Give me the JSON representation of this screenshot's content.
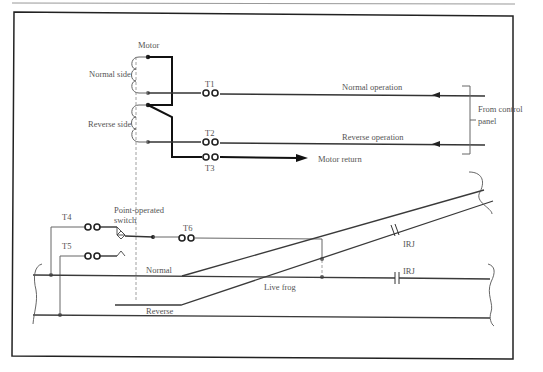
{
  "diagram": {
    "labels": {
      "motor": "Motor",
      "normal_side": "Normal side",
      "reverse_side": "Reverse side",
      "t1": "T1",
      "t2": "T2",
      "t3": "T3",
      "t4": "T4",
      "t5": "T5",
      "t6": "T6",
      "normal_operation": "Normal operation",
      "reverse_operation": "Reverse operation",
      "from_control_panel_1": "From control",
      "from_control_panel_2": "panel",
      "motor_return": "Motor return",
      "point_operated_1": "Point-operated",
      "point_operated_2": "switch",
      "irj_upper": "IRJ",
      "irj_lower": "IRJ",
      "normal_track": "Normal",
      "reverse_track": "Reverse",
      "live_frog": "Live frog"
    },
    "colors": {
      "line": "#333333",
      "thick_line": "#111111",
      "text": "#555555",
      "frame": "#222222"
    }
  }
}
